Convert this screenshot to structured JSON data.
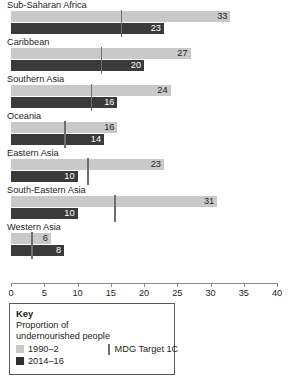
{
  "chart_data": {
    "type": "bar",
    "orientation": "horizontal",
    "title": "",
    "xlabel": "",
    "ylabel": "",
    "xlim": [
      0,
      40
    ],
    "ticks": [
      0,
      5,
      10,
      15,
      20,
      25,
      30,
      35,
      40
    ],
    "grid": false,
    "categories": [
      "Sub-Saharan Africa",
      "Caribbean",
      "Southern Asia",
      "Oceania",
      "Eastern Asia",
      "South-Eastern Asia",
      "Western Asia"
    ],
    "series": [
      {
        "name": "1990–2",
        "color": "#c9c9c9",
        "values": [
          33,
          27,
          24,
          16,
          23,
          31,
          6
        ]
      },
      {
        "name": "2014–16",
        "color": "#3a3a3a",
        "values": [
          23,
          20,
          16,
          14,
          10,
          10,
          8
        ]
      }
    ],
    "markers": {
      "name": "MDG Target 1C",
      "color": "#6f6f6f",
      "values": [
        16.5,
        13.5,
        12,
        8,
        11.5,
        15.5,
        3
      ]
    },
    "legend": {
      "position": "bottom-left",
      "title": "Key",
      "subtitle": "Proportion of undernourished people",
      "entries": [
        "1990–2",
        "2014–16",
        "MDG Target 1C"
      ]
    }
  },
  "axis": {
    "tick_labels": [
      "0",
      "5",
      "10",
      "15",
      "20",
      "25",
      "30",
      "35",
      "40"
    ]
  },
  "legend": {
    "title": "Key",
    "subtitle_line1": "Proportion of",
    "subtitle_line2": "undernourished people",
    "series1_label": "1990–2",
    "series2_label": "2014–16",
    "target_label": "MDG Target 1C"
  }
}
